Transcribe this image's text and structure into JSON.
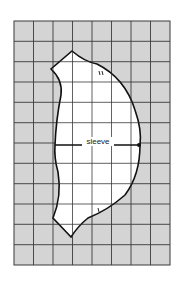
{
  "diagram": {
    "type": "sewing-pattern-grid",
    "piece_label": "sleeve",
    "grid": {
      "columns": 8,
      "rows": 12,
      "fill": "#d4d4d4",
      "line_color": "#3a3a3a"
    },
    "piece": {
      "fill": "#ffffff",
      "outline_color": "#111111"
    },
    "markings": [
      "double notch (back)",
      "single notch (front)",
      "shoulder dot",
      "grainline"
    ]
  }
}
